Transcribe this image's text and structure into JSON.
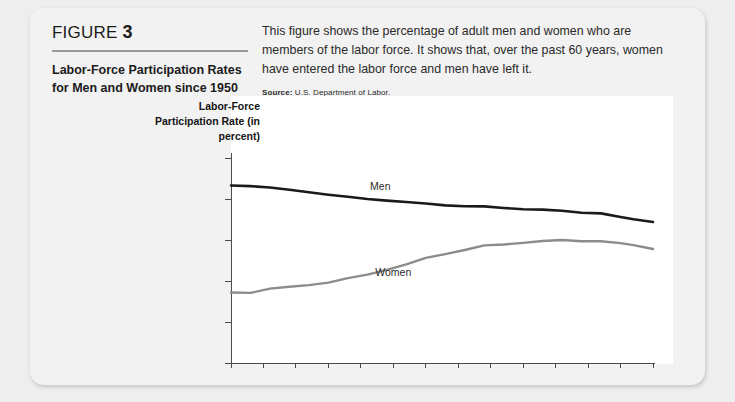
{
  "card": {
    "figure_label_prefix": "FIGURE",
    "figure_number": "3",
    "title": "Labor-Force Participation Rates for Men and Women since 1950",
    "description": "This figure shows the percentage of adult men and women who are members of the labor force. It shows that, over the past 60 years, women have entered the labor force and men have left it.",
    "source_label": "Source:",
    "source_text": "U.S. Department of Labor."
  },
  "chart_data": {
    "type": "line",
    "title": "Labor-Force Participation Rates for Men and Women since 1950",
    "xlabel": "",
    "ylabel": "Labor-Force Participation Rate (in percent)",
    "xlim": [
      1950,
      2015
    ],
    "ylim": [
      0,
      100
    ],
    "xticks": [
      1950,
      1955,
      1960,
      1965,
      1970,
      1975,
      1980,
      1985,
      1990,
      1995,
      2000,
      2005,
      2010,
      2015
    ],
    "yticks": [
      0,
      20,
      40,
      60,
      80,
      100
    ],
    "grid": false,
    "legend": "inline-labels",
    "x": [
      1950,
      1953,
      1956,
      1959,
      1962,
      1965,
      1968,
      1971,
      1974,
      1977,
      1980,
      1983,
      1986,
      1989,
      1992,
      1995,
      1998,
      2001,
      2004,
      2007,
      2010,
      2012,
      2015
    ],
    "series": [
      {
        "name": "Men",
        "color": "#1a1a1a",
        "values": [
          86.6,
          86.3,
          85.6,
          84.5,
          83.3,
          82.1,
          81.1,
          80.0,
          79.2,
          78.5,
          77.8,
          76.9,
          76.5,
          76.4,
          75.6,
          75.0,
          74.8,
          74.3,
          73.3,
          73.0,
          71.2,
          70.1,
          68.8
        ]
      },
      {
        "name": "Women",
        "color": "#8c8c8c",
        "values": [
          34.4,
          34.2,
          36.3,
          37.2,
          38.0,
          39.2,
          41.4,
          43.1,
          45.4,
          48.1,
          51.3,
          53.1,
          55.1,
          57.4,
          57.8,
          58.6,
          59.5,
          60.0,
          59.4,
          59.4,
          58.5,
          57.5,
          55.6
        ]
      }
    ],
    "annotations": [
      {
        "text": "Men",
        "x": 1973,
        "y": 84.5
      },
      {
        "text": "Women",
        "x": 1975,
        "y": 42.5
      }
    ]
  }
}
